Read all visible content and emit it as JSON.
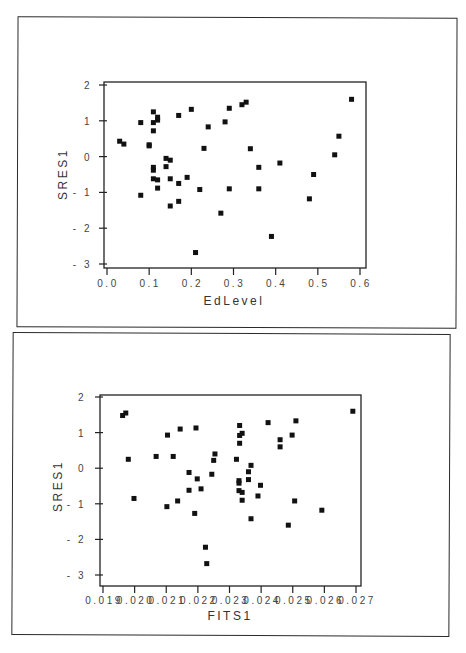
{
  "chart_data": [
    {
      "type": "scatter",
      "title": "",
      "xlabel": "EdLevel",
      "ylabel": "SRES1",
      "xlim": [
        0.0,
        0.6
      ],
      "ylim": [
        -3,
        2
      ],
      "grid": false,
      "legend": null,
      "x_ticks": [
        "0.0",
        "0.1",
        "0.2",
        "0.3",
        "0.4",
        "0.5",
        "0.6"
      ],
      "y_ticks": [
        "2",
        "1",
        "0",
        "-1",
        "-2",
        "-3"
      ],
      "points": [
        [
          0.03,
          0.43
        ],
        [
          0.04,
          0.35
        ],
        [
          0.08,
          0.95
        ],
        [
          0.08,
          -1.08
        ],
        [
          0.1,
          0.33
        ],
        [
          0.1,
          0.3
        ],
        [
          0.11,
          1.25
        ],
        [
          0.11,
          0.95
        ],
        [
          0.11,
          0.72
        ],
        [
          0.11,
          -0.3
        ],
        [
          0.11,
          -0.38
        ],
        [
          0.11,
          -0.62
        ],
        [
          0.12,
          1.1
        ],
        [
          0.12,
          1.02
        ],
        [
          0.12,
          -0.65
        ],
        [
          0.12,
          -0.88
        ],
        [
          0.14,
          -0.05
        ],
        [
          0.14,
          -0.28
        ],
        [
          0.15,
          -0.1
        ],
        [
          0.15,
          -0.62
        ],
        [
          0.15,
          -1.38
        ],
        [
          0.17,
          1.15
        ],
        [
          0.17,
          -0.75
        ],
        [
          0.17,
          -1.25
        ],
        [
          0.19,
          -0.58
        ],
        [
          0.2,
          1.32
        ],
        [
          0.21,
          -2.68
        ],
        [
          0.22,
          -0.92
        ],
        [
          0.23,
          0.23
        ],
        [
          0.24,
          0.83
        ],
        [
          0.27,
          -1.58
        ],
        [
          0.28,
          0.97
        ],
        [
          0.29,
          1.35
        ],
        [
          0.29,
          -0.9
        ],
        [
          0.32,
          1.45
        ],
        [
          0.33,
          1.52
        ],
        [
          0.34,
          0.22
        ],
        [
          0.36,
          -0.3
        ],
        [
          0.36,
          -0.9
        ],
        [
          0.39,
          -2.23
        ],
        [
          0.41,
          -0.18
        ],
        [
          0.48,
          -1.18
        ],
        [
          0.49,
          -0.5
        ],
        [
          0.54,
          0.05
        ],
        [
          0.55,
          0.57
        ],
        [
          0.58,
          1.6
        ]
      ]
    },
    {
      "type": "scatter",
      "title": "",
      "xlabel": "FITS1",
      "ylabel": "SRES1",
      "xlim": [
        0.019,
        0.027
      ],
      "ylim": [
        -3,
        2
      ],
      "grid": false,
      "legend": null,
      "x_ticks": [
        "0.019",
        "0.020",
        "0.021",
        "0.022",
        "0.023",
        "0.024",
        "0.025",
        "0.026",
        "0.027"
      ],
      "y_ticks": [
        "2",
        "1",
        "0",
        "-1",
        "-2",
        "-3"
      ],
      "points": [
        [
          0.01962,
          1.48
        ],
        [
          0.01972,
          1.55
        ],
        [
          0.0198,
          0.25
        ],
        [
          0.01998,
          -0.85
        ],
        [
          0.02068,
          0.33
        ],
        [
          0.02102,
          -1.08
        ],
        [
          0.02104,
          0.93
        ],
        [
          0.02122,
          0.33
        ],
        [
          0.02136,
          -0.92
        ],
        [
          0.02144,
          1.1
        ],
        [
          0.02172,
          -0.12
        ],
        [
          0.02172,
          -0.62
        ],
        [
          0.0219,
          -1.27
        ],
        [
          0.02194,
          1.13
        ],
        [
          0.02198,
          -0.3
        ],
        [
          0.0221,
          -0.58
        ],
        [
          0.02224,
          -2.22
        ],
        [
          0.02228,
          -2.68
        ],
        [
          0.02244,
          -0.17
        ],
        [
          0.0225,
          0.22
        ],
        [
          0.02254,
          0.4
        ],
        [
          0.02322,
          0.25
        ],
        [
          0.0233,
          -0.35
        ],
        [
          0.0233,
          -0.42
        ],
        [
          0.0233,
          -0.63
        ],
        [
          0.02332,
          1.2
        ],
        [
          0.02332,
          0.92
        ],
        [
          0.02332,
          0.7
        ],
        [
          0.0234,
          0.98
        ],
        [
          0.0234,
          -0.68
        ],
        [
          0.0234,
          -0.9
        ],
        [
          0.0236,
          -0.1
        ],
        [
          0.0236,
          -0.32
        ],
        [
          0.02368,
          0.08
        ],
        [
          0.02368,
          -1.42
        ],
        [
          0.0239,
          -0.78
        ],
        [
          0.02398,
          -0.48
        ],
        [
          0.02422,
          1.28
        ],
        [
          0.0246,
          0.8
        ],
        [
          0.0246,
          0.6
        ],
        [
          0.02486,
          -1.6
        ],
        [
          0.02498,
          0.93
        ],
        [
          0.02506,
          -0.92
        ],
        [
          0.0251,
          1.33
        ],
        [
          0.02592,
          -1.18
        ],
        [
          0.0269,
          1.6
        ]
      ]
    }
  ],
  "charts": [
    {
      "xlabel": "EdLevel",
      "ylabel": "SRES1"
    },
    {
      "xlabel": "FITS1",
      "ylabel": "SRES1"
    }
  ]
}
